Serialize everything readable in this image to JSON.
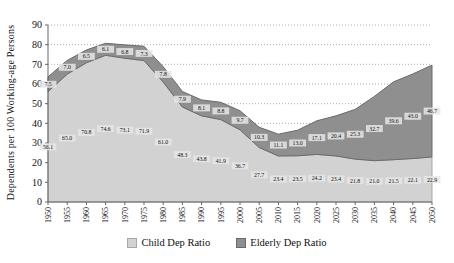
{
  "y_axis": {
    "title": "Dependents per 100 Working-age Persons",
    "min": 0,
    "max": 90,
    "step": 10
  },
  "colors": {
    "child_fill": "#d2d2d2",
    "child_border": "#a8a8a8",
    "elderly_fill": "#8f8f8f",
    "elderly_border": "#6a6a6a",
    "label_chip": "#e6e6e6",
    "gridline": "#8c8c8c",
    "axis": "#666666",
    "text": "#111111"
  },
  "chart_data": {
    "type": "area",
    "stacked": true,
    "title": "",
    "xlabel": "",
    "ylabel": "Dependents per 100 Working-age Persons",
    "ylim": [
      0,
      90
    ],
    "ytick_step": 10,
    "grid": "dotted-horizontal",
    "legend_position": "bottom",
    "x": [
      1950,
      1955,
      1960,
      1965,
      1970,
      1975,
      1980,
      1985,
      1990,
      1995,
      2000,
      2005,
      2010,
      2015,
      2020,
      2025,
      2030,
      2035,
      2040,
      2045,
      2050
    ],
    "series": [
      {
        "name": "Child Dep Ratio",
        "values": [
          56.1,
          65.0,
          70.8,
          74.6,
          73.1,
          71.9,
          61.0,
          48.3,
          43.8,
          41.9,
          36.7,
          27.7,
          23.4,
          23.5,
          24.2,
          23.4,
          21.8,
          21.0,
          21.5,
          22.1,
          22.9
        ]
      },
      {
        "name": "Elderly Dep Ratio",
        "values": [
          7.5,
          7.0,
          6.5,
          6.1,
          6.8,
          7.3,
          7.8,
          7.9,
          8.1,
          8.8,
          9.7,
          10.3,
          11.1,
          13.0,
          17.1,
          20.4,
          25.3,
          32.7,
          39.6,
          43.0,
          46.7
        ]
      }
    ]
  }
}
